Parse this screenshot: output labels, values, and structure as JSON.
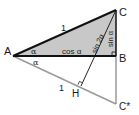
{
  "diagram": {
    "type": "geometry",
    "points": {
      "A": {
        "label": "A",
        "x": 13,
        "y": 56
      },
      "B": {
        "label": "B",
        "x": 116,
        "y": 56
      },
      "C": {
        "label": "C",
        "x": 116,
        "y": 10
      },
      "C_star": {
        "label": "C*",
        "x": 116,
        "y": 104
      },
      "H": {
        "label": "H",
        "x": 81,
        "y": 86
      }
    },
    "labels": {
      "hyp_top": "1",
      "hyp_bottom": "1",
      "angle_top": "α",
      "angle_bottom": "α",
      "adjacent": "cos α",
      "opposite": "sin α",
      "altitude": "sin 2α"
    },
    "colors": {
      "fill": "#c8c8c8",
      "dark_line": "#111111",
      "light_line": "#999999"
    }
  }
}
